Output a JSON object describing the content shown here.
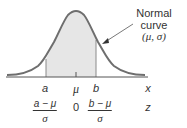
{
  "diagram": {
    "annotation": {
      "title": "Normal curve",
      "params": "(μ, σ)"
    },
    "x_axis": {
      "labels": [
        "a",
        "μ",
        "b"
      ],
      "variable": "x"
    },
    "z_axis": {
      "left_fraction": {
        "numerator": "a − μ",
        "denominator": "σ"
      },
      "center": "0",
      "right_fraction": {
        "numerator": "b − μ",
        "denominator": "σ"
      },
      "variable": "z"
    },
    "colors": {
      "curve": "#6e6e6e",
      "shade": "#e6e6e6",
      "axis": "#555555",
      "text": "#333333"
    }
  }
}
